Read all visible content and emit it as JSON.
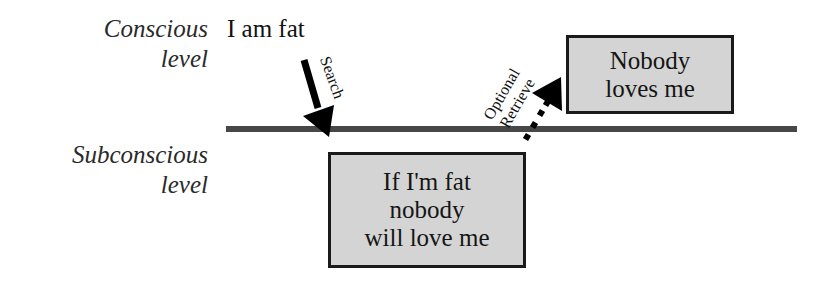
{
  "levels": {
    "conscious": {
      "line1": "Conscious",
      "line2": "level"
    },
    "subconscious": {
      "line1": "Subconscious",
      "line2": "level"
    }
  },
  "thought": "I am fat",
  "arrows": {
    "search": {
      "label": "Search",
      "style": "solid"
    },
    "retrieve": {
      "label_line1": "Optional",
      "label_line2": "Retrieve",
      "style": "dotted"
    }
  },
  "boxes": {
    "belief": {
      "lines": [
        "If I'm fat",
        "nobody",
        "will love me"
      ]
    },
    "conclusion": {
      "lines": [
        "Nobody",
        "loves me"
      ]
    }
  },
  "colors": {
    "box_fill": "#d4d4d4",
    "divider": "#474747",
    "arrow": "#000000"
  }
}
